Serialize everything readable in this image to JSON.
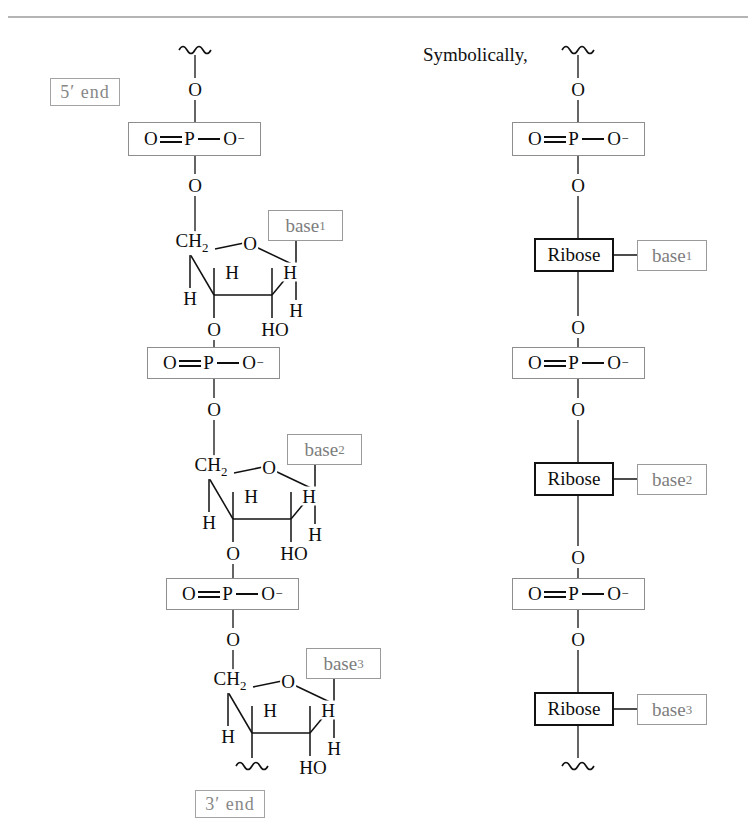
{
  "figure": {
    "title_note": "Symbolically,",
    "top_rule": true
  },
  "labels": {
    "five_prime_end": "5′ end",
    "three_prime_end": "3′ end",
    "symbolically": "Symbolically,"
  },
  "atoms": {
    "O": "O",
    "H": "H",
    "HO": "HO",
    "CH2": "CH",
    "CH2_sub": "2",
    "P": "P",
    "O_minus": "O",
    "minus": "–"
  },
  "phosphate": {
    "left_o": "O",
    "p": "P",
    "right_o": "O",
    "charge": "−"
  },
  "ribose": {
    "label": "Ribose"
  },
  "bases": [
    {
      "label": "base",
      "sub": "1"
    },
    {
      "label": "base",
      "sub": "2"
    },
    {
      "label": "base",
      "sub": "3"
    }
  ],
  "left_column": {
    "name": "detailed-structure",
    "units": [
      {
        "base_index": 1,
        "phosphate_top_o": "O",
        "phosphate_bottom_o": "O",
        "ring_ch2": "CH2",
        "ring_o": "O",
        "ring_h_upper_left": "H",
        "ring_h_upper_right": "H",
        "ring_h_left": "H",
        "ring_h_right": "H",
        "ring_o_bottom_left": "O",
        "ring_ho_bottom_right": "HO"
      },
      {
        "base_index": 2,
        "phosphate_top_o": "O",
        "phosphate_bottom_o": "O",
        "ring_ch2": "CH2",
        "ring_o": "O",
        "ring_h_upper_left": "H",
        "ring_h_upper_right": "H",
        "ring_h_left": "H",
        "ring_h_right": "H",
        "ring_o_bottom_left": "O",
        "ring_ho_bottom_right": "HO"
      },
      {
        "base_index": 3,
        "phosphate_top_o": "O",
        "phosphate_bottom_o": "O",
        "ring_ch2": "CH2",
        "ring_o": "O",
        "ring_h_upper_left": "H",
        "ring_h_upper_right": "H",
        "ring_h_left": "H",
        "ring_h_right": "H",
        "ring_o_bottom_left": "",
        "ring_ho_bottom_right": "HO"
      }
    ]
  },
  "right_column": {
    "name": "symbolic-structure",
    "units": [
      {
        "base_index": 1,
        "top_o": "O",
        "bottom_o": "O",
        "ribose": "Ribose"
      },
      {
        "base_index": 2,
        "top_o": "O",
        "bottom_o": "O",
        "ribose": "Ribose"
      },
      {
        "base_index": 3,
        "top_o": "O",
        "bottom_o": "O",
        "ribose": "Ribose"
      }
    ]
  },
  "colors": {
    "ink": "#0d0d0d",
    "gray_label": "#7d7d7d",
    "gray_border": "#9a9a9a",
    "rule": "#999999",
    "background": "#ffffff"
  }
}
